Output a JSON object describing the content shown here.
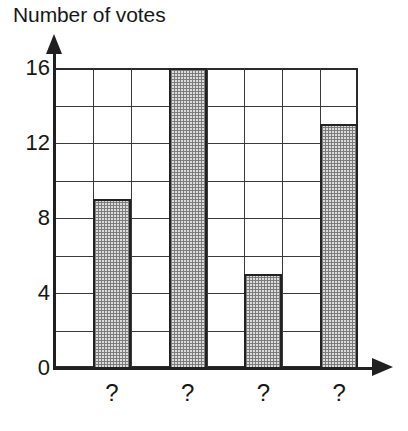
{
  "chart_data": {
    "type": "bar",
    "title": "Number of votes",
    "xlabel": "",
    "ylabel": "",
    "categories": [
      "?",
      "?",
      "?",
      "?"
    ],
    "values": [
      9,
      16,
      5,
      13
    ],
    "ylim": [
      0,
      16
    ],
    "y_tick_labels": [
      "0",
      "4",
      "8",
      "12",
      "16"
    ],
    "y_tick_values": [
      0,
      4,
      8,
      12,
      16
    ],
    "gridline_values": [
      0,
      2,
      4,
      6,
      8,
      10,
      12,
      14,
      16
    ],
    "grid": true,
    "legend": "none",
    "bar_fill": "#dcdcdc",
    "bar_border": "#222222",
    "axis_color": "#202020",
    "grid_color": "#3a3a3a",
    "background": "#ffffff",
    "columns": 8,
    "bar_columns": [
      1,
      3,
      5,
      7
    ],
    "annotations": []
  },
  "axes": {
    "y_arrow": "up-arrow-icon",
    "x_arrow": "right-arrow-icon"
  }
}
